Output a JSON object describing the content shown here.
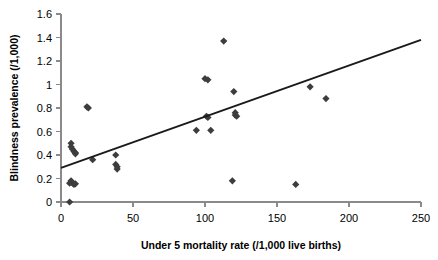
{
  "chart_data": {
    "type": "scatter",
    "title": "",
    "xlabel": "Under 5 mortality rate (/1,000 live births)",
    "ylabel": "Blindness prevalence (/1,000)",
    "xlim": [
      0,
      250
    ],
    "ylim": [
      0,
      1.6
    ],
    "xticks": [
      0,
      50,
      100,
      150,
      200,
      250
    ],
    "yticks": [
      0,
      0.2,
      0.4,
      0.6,
      0.8,
      1,
      1.2,
      1.4,
      1.6
    ],
    "xtick_labels": [
      "0",
      "50",
      "100",
      "150",
      "200",
      "250"
    ],
    "ytick_labels": [
      "0",
      "0.2",
      "0.4",
      "0.6",
      "0.8",
      "1",
      "1.2",
      "1.4",
      "1.6"
    ],
    "grid": false,
    "legend": "none",
    "marker_shape": "diamond",
    "marker_color": "#3d3d3d",
    "points": [
      {
        "x": 6,
        "y": 0.0
      },
      {
        "x": 6,
        "y": 0.16
      },
      {
        "x": 7,
        "y": 0.18
      },
      {
        "x": 8,
        "y": 0.16
      },
      {
        "x": 9,
        "y": 0.15
      },
      {
        "x": 10,
        "y": 0.155
      },
      {
        "x": 7,
        "y": 0.5
      },
      {
        "x": 7,
        "y": 0.47
      },
      {
        "x": 8,
        "y": 0.45
      },
      {
        "x": 9,
        "y": 0.43
      },
      {
        "x": 10,
        "y": 0.42
      },
      {
        "x": 10,
        "y": 0.41
      },
      {
        "x": 18,
        "y": 0.81
      },
      {
        "x": 19,
        "y": 0.8
      },
      {
        "x": 22,
        "y": 0.36
      },
      {
        "x": 38,
        "y": 0.4
      },
      {
        "x": 38,
        "y": 0.32
      },
      {
        "x": 39,
        "y": 0.3
      },
      {
        "x": 39,
        "y": 0.28
      },
      {
        "x": 94,
        "y": 0.61
      },
      {
        "x": 100,
        "y": 1.05
      },
      {
        "x": 102,
        "y": 1.04
      },
      {
        "x": 101,
        "y": 0.73
      },
      {
        "x": 102,
        "y": 0.72
      },
      {
        "x": 104,
        "y": 0.61
      },
      {
        "x": 113,
        "y": 1.37
      },
      {
        "x": 120,
        "y": 0.94
      },
      {
        "x": 121,
        "y": 0.76
      },
      {
        "x": 121,
        "y": 0.74
      },
      {
        "x": 122,
        "y": 0.73
      },
      {
        "x": 119,
        "y": 0.18
      },
      {
        "x": 163,
        "y": 0.15
      },
      {
        "x": 173,
        "y": 0.98
      },
      {
        "x": 184,
        "y": 0.88
      }
    ],
    "trend_line": {
      "x_start": 0,
      "y_start": 0.29,
      "x_end": 250,
      "y_end": 1.38
    }
  }
}
